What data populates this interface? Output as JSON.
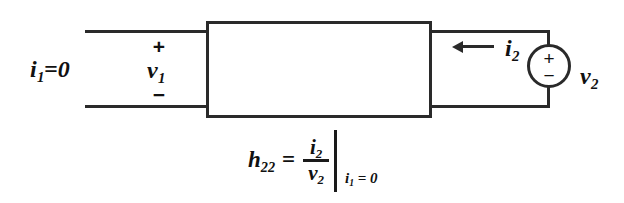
{
  "diagram": {
    "type": "circuit-schematic",
    "stroke_color": "#2a2a2a",
    "background_color": "#ffffff",
    "two_port_block": {
      "label": "",
      "description": "two-port network block"
    },
    "left_port": {
      "current_label": "i",
      "current_subscript": "1",
      "current_value": "=0",
      "current_label_full": "i1=0",
      "voltage_label": "v",
      "voltage_subscript": "1",
      "polarity_plus": "+",
      "polarity_minus": "−"
    },
    "right_port": {
      "current_label": "i",
      "current_subscript": "2",
      "current_direction": "left",
      "source_type": "independent-voltage-source",
      "source_plus": "+",
      "source_minus": "−",
      "voltage_label": "v",
      "voltage_subscript": "2"
    },
    "equation": {
      "lhs": "h",
      "lhs_subscript": "22",
      "equals": "=",
      "numerator": "i",
      "numerator_subscript": "2",
      "denominator": "v",
      "denominator_subscript": "2",
      "condition_var": "i",
      "condition_subscript": "1",
      "condition_value": "= 0",
      "plain_text": "h22 = i2/v2 | i1 = 0"
    }
  }
}
